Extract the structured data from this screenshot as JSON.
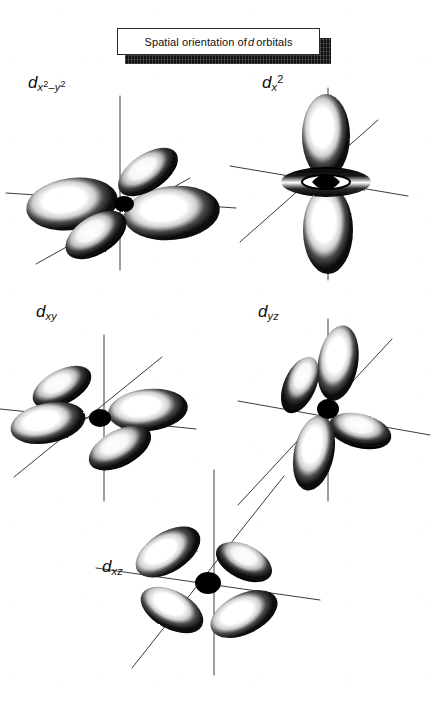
{
  "figure": {
    "kind": "textbook-figure",
    "background_color": "#ffffff",
    "ink_color": "#111111",
    "axis_color": "#3a3a3a",
    "banner": {
      "text_before": "Spatial orientation of",
      "italic_symbol": "d",
      "text_after": "orbitals",
      "full_text": "Spatial orientation of d orbitals",
      "box_fill": "#ffffff",
      "box_border": "#2a2a2a",
      "shadow_fill": "#101010"
    },
    "orbitals": [
      {
        "id": "dx2-y2",
        "label_symbol": "d",
        "label_sub": "x",
        "label_sub_exp": "2",
        "label_minus": "–",
        "label_sub2": "y",
        "label_sub2_exp": "2",
        "label_plain": "dx2–y2",
        "shape": "four-lobe-cloverleaf",
        "position": "top-left",
        "lobe_count": 4
      },
      {
        "id": "dx2",
        "label_symbol": "d",
        "label_sub": "x",
        "label_sup": "2",
        "label_plain": "dx2",
        "shape": "two-lobe-with-torus",
        "position": "top-right",
        "lobe_count": 2,
        "has_torus": true
      },
      {
        "id": "dxy",
        "label_symbol": "d",
        "label_sub": "xy",
        "label_plain": "dxy",
        "shape": "four-lobe-cloverleaf",
        "position": "middle-left",
        "lobe_count": 4
      },
      {
        "id": "dyz",
        "label_symbol": "d",
        "label_sub": "yz",
        "label_plain": "dyz",
        "shape": "four-lobe-cloverleaf",
        "position": "middle-right",
        "lobe_count": 4
      },
      {
        "id": "dxz",
        "label_symbol": "d",
        "label_sub": "xz",
        "label_plain": "dxz",
        "shape": "four-lobe-cloverleaf",
        "position": "bottom-center",
        "lobe_count": 4
      }
    ]
  }
}
